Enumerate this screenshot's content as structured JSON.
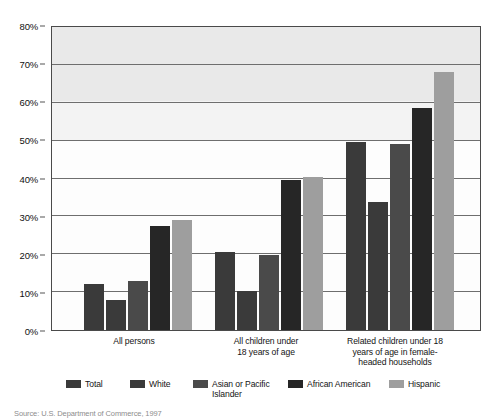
{
  "chart_data": {
    "type": "bar",
    "title": "",
    "subtitle": "",
    "xlabel": "",
    "ylabel": "",
    "ylim": [
      0,
      80
    ],
    "ytick_labels": [
      "0%",
      "10%",
      "20%",
      "30%",
      "40%",
      "50%",
      "60%",
      "70%",
      "80%"
    ],
    "ytick_values": [
      0,
      10,
      20,
      30,
      40,
      50,
      60,
      70,
      80
    ],
    "grid": true,
    "legend_position": "bottom",
    "categories": [
      "All persons",
      "All children under\n18 years of age",
      "Related children under 18\nyears of age in female-\nheaded households"
    ],
    "series": [
      {
        "name": "Total",
        "color": "#3a3a3a",
        "values": [
          12.2,
          20.5,
          49.7
        ]
      },
      {
        "name": "White",
        "color": "#3a3a3a",
        "values": [
          8.0,
          10.2,
          33.8
        ]
      },
      {
        "name": "Asian or Pacific\nIslander",
        "color": "#4a4a4a",
        "values": [
          13.0,
          19.9,
          49.0
        ]
      },
      {
        "name": "African American",
        "color": "#262626",
        "values": [
          27.5,
          39.5,
          58.6
        ]
      },
      {
        "name": "Hispanic",
        "color": "#9e9e9e",
        "values": [
          29.0,
          40.5,
          68.0
        ]
      }
    ]
  },
  "legend": {
    "items": [
      {
        "label": "Total",
        "color": "#3a3a3a",
        "left": 66
      },
      {
        "label": "White",
        "color": "#3a3a3a",
        "left": 130
      },
      {
        "label": "Asian or Pacific\nIslander",
        "color": "#4a4a4a",
        "left": 193
      },
      {
        "label": "African American",
        "color": "#262626",
        "left": 288
      },
      {
        "label": "Hispanic",
        "color": "#9e9e9e",
        "left": 389
      }
    ]
  },
  "source": {
    "text": "Source: U.S. Department of Commerce, 1997"
  }
}
